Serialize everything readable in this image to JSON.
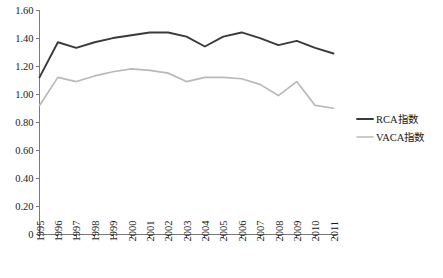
{
  "chart_data": {
    "type": "line",
    "title": "",
    "xlabel": "",
    "ylabel": "",
    "grid": false,
    "legend_position": "right",
    "ylim": [
      0,
      1.6
    ],
    "ytick_labels": [
      "1.60",
      "1.40",
      "1.20",
      "1.00",
      "0.80",
      "0.60",
      "0.40",
      "0.20",
      "0"
    ],
    "ytick_values": [
      1.6,
      1.4,
      1.2,
      1.0,
      0.8,
      0.6,
      0.4,
      0.2,
      0
    ],
    "categories": [
      "1995",
      "1996",
      "1997",
      "1998",
      "1999",
      "2000",
      "2001",
      "2002",
      "2003",
      "2004",
      "2005",
      "2006",
      "2007",
      "2008",
      "2009",
      "2010",
      "2011"
    ],
    "series": [
      {
        "name": "RCA指数",
        "color": "#3a3a3a",
        "width": 1.9,
        "values": [
          1.12,
          1.37,
          1.33,
          1.37,
          1.4,
          1.42,
          1.44,
          1.44,
          1.41,
          1.34,
          1.41,
          1.44,
          1.4,
          1.35,
          1.38,
          1.33,
          1.29
        ]
      },
      {
        "name": "VACA指数",
        "color": "#b9b9b9",
        "width": 1.7,
        "values": [
          0.92,
          1.12,
          1.09,
          1.13,
          1.16,
          1.18,
          1.17,
          1.15,
          1.09,
          1.12,
          1.12,
          1.11,
          1.07,
          0.99,
          1.09,
          0.92,
          0.9
        ]
      }
    ]
  },
  "legend": {
    "items": [
      {
        "label": "RCA指数",
        "color": "#3a3a3a"
      },
      {
        "label": "VACA指数",
        "color": "#b9b9b9"
      }
    ]
  },
  "axes": {
    "y_axis_color": "#7a7a7a",
    "x_axis_color": "#7a7a7a"
  }
}
